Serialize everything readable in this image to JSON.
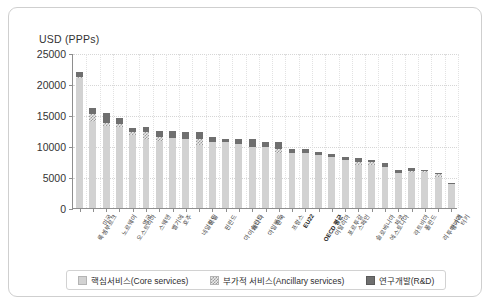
{
  "chart_data": {
    "type": "bar",
    "stacked": true,
    "title": "",
    "xlabel": "",
    "ylabel": "USD (PPPs)",
    "ylim": [
      0,
      25000
    ],
    "yticks": [
      0,
      5000,
      10000,
      15000,
      20000,
      25000
    ],
    "ytick_labels": [
      "0",
      "5000",
      "10000",
      "15000",
      "20000",
      "25000"
    ],
    "grid": true,
    "legend_position": "bottom",
    "legend": [
      "핵심서비스(Core services)",
      "부가적 서비스(Ancillary services)",
      "연구개발(R&D)"
    ],
    "categories": [
      "룩셈부르크",
      "미국",
      "노르웨이",
      "오스트리아",
      "영국",
      "스웨덴",
      "벨기에",
      "호주",
      "네덜란드",
      "독일",
      "핀란드",
      "아이슬란드",
      "캐나다",
      "아일랜드",
      "한국",
      "프랑스",
      "EU22",
      "OECD 평균",
      "이탈리아",
      "포르투갈",
      "스페인",
      "슬로베니아",
      "에스토니아",
      "체코",
      "라트비아",
      "폴란드",
      "리투아니아",
      "헝가리",
      "터키"
    ],
    "highlight_categories": [
      "EU22",
      "OECD 평균"
    ],
    "series": [
      {
        "name": "핵심서비스(Core services)",
        "color": "#d2d2d2",
        "values": [
          20900,
          13900,
          13200,
          13100,
          11700,
          10900,
          10800,
          11300,
          11200,
          10100,
          10700,
          10600,
          10400,
          9900,
          9900,
          8800,
          8900,
          8900,
          8500,
          8200,
          7700,
          7000,
          6900,
          6600,
          5700,
          5700,
          5600,
          5000,
          3900
        ]
      },
      {
        "name": "부가적 서비스(Ancillary services)",
        "color": "#e9e9e9",
        "values": [
          300,
          1300,
          500,
          500,
          600,
          1400,
          700,
          0,
          0,
          1000,
          0,
          0,
          0,
          0,
          0,
          700,
          0,
          0,
          0,
          0,
          0,
          500,
          600,
          0,
          0,
          300,
          300,
          500,
          0
        ]
      },
      {
        "name": "연구개발(R&D)",
        "color": "#6f6f6f",
        "values": [
          800,
          1000,
          1700,
          1000,
          600,
          700,
          900,
          1100,
          1000,
          1200,
          700,
          500,
          700,
          1200,
          800,
          1200,
          700,
          600,
          500,
          500,
          600,
          500,
          300,
          700,
          400,
          400,
          300,
          200,
          200
        ]
      }
    ],
    "totals": [
      22000,
      16200,
      15400,
      14600,
      12900,
      13000,
      12400,
      12400,
      12200,
      12300,
      11400,
      11100,
      11100,
      11100,
      10700,
      10700,
      9600,
      9500,
      9000,
      8700,
      8300,
      8000,
      7800,
      7300,
      6100,
      6400,
      6200,
      5700,
      4100
    ]
  }
}
